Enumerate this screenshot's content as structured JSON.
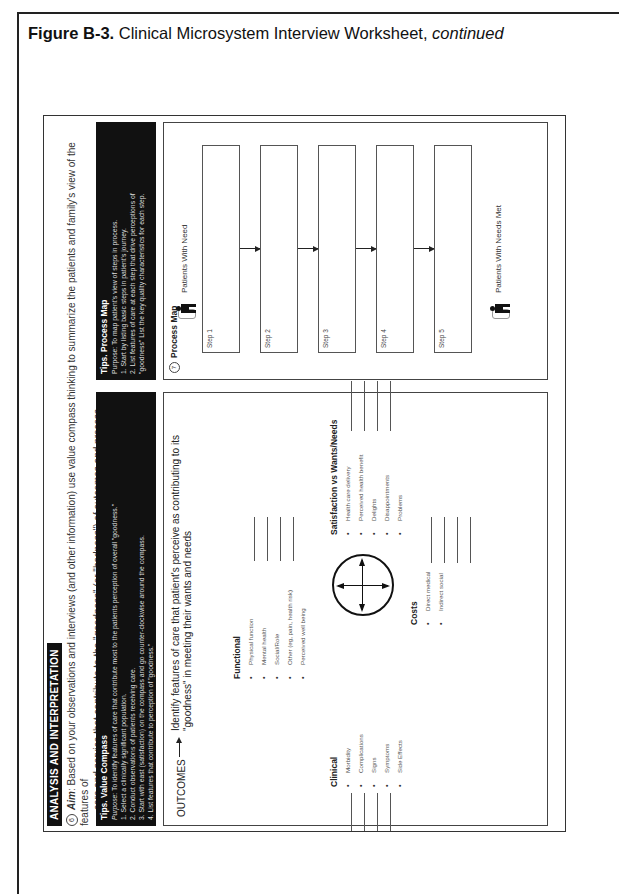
{
  "figure": {
    "label": "Figure B-3.",
    "title": "Clinical Microsystem Interview Worksheet,",
    "title_suffix": "continued"
  },
  "worksheet": {
    "orientation": "rotated-90-ccw",
    "header": "ANALYSIS AND INTERPRETATION",
    "aim": {
      "number": "6",
      "label": "Aim",
      "line1": ": Based on your observations and interviews (and other information) use value compass thinking to summarize the patients and family's view of the features of",
      "line2": "care and service that contribute to the \"goodness\" (or \"badness\") of outcomes and process."
    },
    "tips_value_compass": {
      "title": "Tips. Value Compass",
      "purpose_label": "Purpose",
      "purpose": ": To identify features of care that contribute most to the patients perception of overall \"goodness.\"",
      "steps": [
        "1.  Select a clinically significant population.",
        "2.  Conduct observations of patients receiving care.",
        "3.  Start with east (satisfaction) on the compass and go counter-clockwise around the compass.",
        "4.  List features that contribute to perception of \"goodness.\""
      ]
    },
    "tips_process_map": {
      "title": "Tips. Process Map",
      "purpose": "Purpose: To map patient's view of steps in process.",
      "steps": [
        "1. Start by listing basic steps in patient's journey.",
        "2. List features of care at each step that drive perceptions of",
        "\"goodness\" List  the key quality characteristics for each step."
      ]
    },
    "outcomes": {
      "label": "OUTCOMES",
      "description": "Identify features of care that patient's perceive as contributing to its \"goodness\" in meeting their wants and needs",
      "functional": {
        "title": "Functional",
        "items": [
          "Physical function",
          "Mental health",
          "Social/Role",
          "Other (eg, pain, health risk)",
          "Perceived well being"
        ]
      },
      "clinical": {
        "title": "Clinical",
        "items": [
          "Morbidity",
          "Complications",
          "Signs",
          "Symptoms",
          "Side Effects"
        ]
      },
      "satisfaction": {
        "title": "Satisfaction vs Wants/Needs",
        "items": [
          "Health care delivery",
          "Perceived health benefit",
          "Delights",
          "Disappointments",
          "Problems"
        ]
      },
      "costs": {
        "title": "Costs",
        "items": [
          "Direct medical",
          "Indirect social"
        ]
      }
    },
    "process_map": {
      "number": "7",
      "title": "Process Map",
      "start_label": "Patients With Need",
      "end_label": "Patients With Needs Met",
      "steps": [
        "Step 1",
        "Step 2",
        "Step 3",
        "Step 4",
        "Step 5"
      ]
    }
  }
}
